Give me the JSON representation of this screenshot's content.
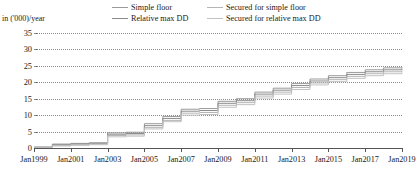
{
  "axis": {
    "y_unit_label": "in ('000)/year",
    "y_ticks": [
      0,
      5,
      10,
      15,
      20,
      25,
      30,
      35
    ],
    "x_ticks": [
      "Jan1999",
      "Jan2001",
      "Jan2003",
      "Jan2005",
      "Jan2007",
      "Jan2009",
      "Jan2011",
      "Jan2013",
      "Jan2015",
      "Jan2017",
      "Jan2019"
    ]
  },
  "legend": {
    "items": [
      {
        "label": "Simple floor",
        "color": "#9a9a9a"
      },
      {
        "label": "Relative max DD",
        "color": "#8a8a8a"
      },
      {
        "label": "Secured for simple floor",
        "color": "#b5b5b5"
      },
      {
        "label": "Secured for relative max DD",
        "color": "#c2c2c2"
      }
    ]
  },
  "chart_data": {
    "type": "line",
    "title": "",
    "xlabel": "",
    "ylabel": "in ('000)/year",
    "ylim": [
      0,
      35
    ],
    "xlim": [
      "Jan1999",
      "Jan2019"
    ],
    "grid": true,
    "legend_position": "top",
    "step": true,
    "x": [
      "Jan1999",
      "Jan2000",
      "Jan2001",
      "Jan2002",
      "Jan2003",
      "Jan2004",
      "Jan2005",
      "Jan2006",
      "Jan2007",
      "Jan2008",
      "Jan2009",
      "Jan2010",
      "Jan2011",
      "Jan2012",
      "Jan2013",
      "Jan2014",
      "Jan2015",
      "Jan2016",
      "Jan2017",
      "Jan2018",
      "Jan2019"
    ],
    "series": [
      {
        "name": "Simple floor",
        "color": "#9a9a9a",
        "values": [
          0.3,
          1.2,
          1.4,
          1.6,
          4.6,
          4.8,
          7.4,
          9.6,
          11.8,
          12.0,
          14.2,
          15.0,
          17.0,
          18.2,
          19.6,
          21.0,
          22.0,
          23.0,
          23.8,
          24.4,
          24.6
        ]
      },
      {
        "name": "Relative max DD",
        "color": "#8a8a8a",
        "values": [
          0.2,
          1.0,
          1.2,
          1.4,
          4.2,
          4.4,
          6.8,
          9.0,
          11.2,
          11.4,
          13.6,
          14.4,
          16.4,
          17.6,
          19.0,
          20.4,
          21.4,
          22.4,
          23.2,
          23.8,
          24.2
        ]
      },
      {
        "name": "Secured for simple floor",
        "color": "#b5b5b5",
        "values": [
          0.1,
          0.8,
          1.0,
          1.2,
          3.8,
          4.0,
          6.2,
          8.4,
          10.6,
          10.8,
          13.0,
          13.8,
          15.8,
          17.0,
          18.4,
          19.8,
          20.8,
          21.8,
          22.6,
          23.2,
          23.6
        ]
      },
      {
        "name": "Secured for relative max DD",
        "color": "#c2c2c2",
        "values": [
          0.0,
          0.6,
          0.8,
          1.0,
          3.4,
          3.6,
          5.8,
          8.0,
          10.0,
          10.2,
          12.4,
          13.2,
          15.2,
          16.4,
          17.8,
          19.2,
          20.2,
          21.2,
          22.0,
          22.6,
          23.0
        ]
      }
    ]
  }
}
